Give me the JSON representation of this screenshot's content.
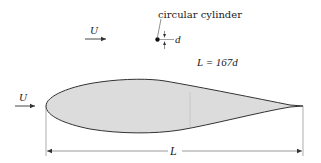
{
  "diagram": {
    "type": "schematic",
    "labels": {
      "cylinder": "circular cylinder",
      "cylinder_diameter": "d",
      "freestream_top": "U",
      "freestream_left": "U",
      "chord_relation": "L = 167d",
      "chord": "L"
    },
    "colors": {
      "airfoil_fill": "#dcdcdc",
      "stroke": "#333333",
      "text": "#222222",
      "background": "#ffffff"
    }
  }
}
